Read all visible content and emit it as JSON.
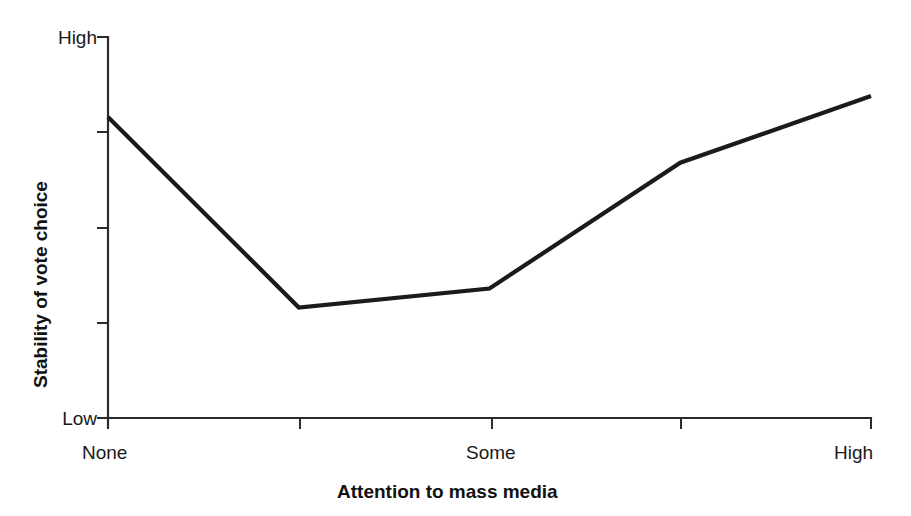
{
  "chart_data": {
    "type": "line",
    "title": "",
    "xlabel": "Attention to mass media",
    "ylabel": "Stability of vote choice",
    "x_tick_labels": [
      "None",
      "",
      "Some",
      "",
      "High"
    ],
    "y_tick_labels": [
      "High",
      "",
      "",
      "",
      "Low"
    ],
    "y_axis_top_label": "High",
    "y_axis_bottom_label": "Low",
    "xlim": [
      0,
      4
    ],
    "ylim": [
      0,
      1
    ],
    "grid": false,
    "legend": false,
    "series": [
      {
        "name": "Stability of vote choice",
        "x": [
          0,
          1,
          2,
          3,
          4
        ],
        "values": [
          0.79,
          0.29,
          0.34,
          0.67,
          0.845
        ],
        "color": "#1b1b1b"
      }
    ],
    "n_x_ticks": 5,
    "n_y_ticks": 5
  },
  "axis": {
    "y_high": "High",
    "y_low": "Low",
    "y_title": "Stability of vote choice",
    "x_none": "None",
    "x_some": "Some",
    "x_high": "High",
    "x_title": "Attention to mass media"
  },
  "colors": {
    "line": "#1b1b1b",
    "axis": "#2b2b2b",
    "background": "#ffffff",
    "text": "#1a1a1a"
  },
  "geometry": {
    "plot_left": 108,
    "plot_right": 871,
    "plot_top": 37,
    "plot_bottom": 418
  }
}
